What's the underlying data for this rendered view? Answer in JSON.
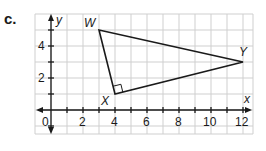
{
  "problem": {
    "label": "c."
  },
  "colors": {
    "grid": "#cfcfcf",
    "axis": "#1a1a1a",
    "triangle": "#1a1a1a",
    "background": "#ffffff"
  },
  "axes": {
    "x_label": "x",
    "y_label": "y",
    "origin_label": "0",
    "x_ticks": [
      "2",
      "4",
      "6",
      "8",
      "10",
      "12"
    ],
    "y_ticks": [
      "2",
      "4"
    ]
  },
  "triangle": {
    "vertices": [
      {
        "name": "W",
        "x": 3,
        "y": 5
      },
      {
        "name": "X",
        "x": 4,
        "y": 1
      },
      {
        "name": "Y",
        "x": 12,
        "y": 3
      }
    ],
    "right_angle_at": "X"
  }
}
